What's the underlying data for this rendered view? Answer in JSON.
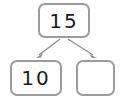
{
  "diagram": {
    "type": "number-bond-part-whole",
    "whole": {
      "label": "15",
      "filled": true
    },
    "parts": [
      {
        "label": "10",
        "filled": true
      },
      {
        "label": "",
        "filled": false
      }
    ],
    "connectors": [
      {
        "from": "whole",
        "to": "part-left",
        "style": "arrow"
      },
      {
        "from": "whole",
        "to": "part-right",
        "style": "arrow"
      }
    ],
    "colors": {
      "box_border": "#9c9c9c",
      "box_fill": "#ffffff",
      "text": "#1b1b1b",
      "arrow": "#8e8e8e",
      "background": "#fefefe"
    }
  }
}
